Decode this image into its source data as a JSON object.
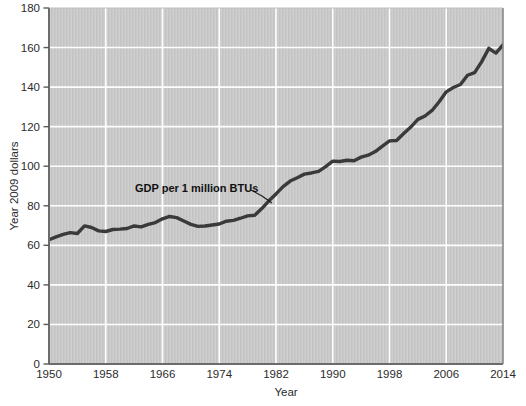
{
  "chart_data": {
    "type": "line",
    "title": "",
    "xlabel": "Year",
    "ylabel": "Year 2009 dollars",
    "xlim": [
      1950,
      2014
    ],
    "ylim": [
      0,
      180
    ],
    "grid": true,
    "legend_position": "none",
    "xticks": [
      1950,
      1958,
      1966,
      1974,
      1982,
      1990,
      1998,
      2006,
      2014
    ],
    "yticks": [
      0,
      20,
      40,
      60,
      80,
      100,
      120,
      140,
      160,
      180
    ],
    "annotations": [
      {
        "text": "GDP per 1 million BTUs",
        "x": 1963.5,
        "y": 88,
        "leader_to_x": 1981.5,
        "leader_to_y": 80
      }
    ],
    "series": [
      {
        "name": "GDP per 1 million BTUs",
        "color": "#3a3a3a",
        "x": [
          1950,
          1951,
          1952,
          1953,
          1954,
          1955,
          1956,
          1957,
          1958,
          1959,
          1960,
          1961,
          1962,
          1963,
          1964,
          1965,
          1966,
          1967,
          1968,
          1969,
          1970,
          1971,
          1972,
          1973,
          1974,
          1975,
          1976,
          1977,
          1978,
          1979,
          1980,
          1981,
          1982,
          1983,
          1984,
          1985,
          1986,
          1987,
          1988,
          1989,
          1990,
          1991,
          1992,
          1993,
          1994,
          1995,
          1996,
          1997,
          1998,
          1999,
          2000,
          2001,
          2002,
          2003,
          2004,
          2005,
          2006,
          2007,
          2008,
          2009,
          2010,
          2011,
          2012,
          2013,
          2014
        ],
        "values": [
          62.8,
          64.3,
          65.5,
          66.4,
          66.0,
          69.8,
          69.0,
          67.3,
          67.0,
          68.0,
          68.2,
          68.5,
          69.8,
          69.3,
          70.6,
          71.5,
          73.4,
          74.6,
          74.0,
          72.3,
          70.6,
          69.6,
          69.8,
          70.3,
          70.8,
          72.2,
          72.6,
          73.7,
          74.9,
          75.2,
          78.6,
          82.5,
          86.0,
          89.7,
          92.5,
          94.2,
          96.0,
          96.6,
          97.4,
          99.8,
          102.6,
          102.4,
          103.0,
          102.8,
          104.6,
          105.6,
          107.4,
          110.2,
          112.8,
          113.0,
          116.5,
          119.8,
          123.7,
          125.4,
          128.2,
          132.6,
          137.6,
          139.8,
          141.3,
          146.0,
          147.3,
          152.9,
          159.6,
          157.2,
          161.3
        ]
      }
    ]
  },
  "axes": {
    "y_label": "Year 2009 dollars",
    "x_label": "Year",
    "y_tick_labels": [
      "180",
      "160",
      "140",
      "120",
      "100",
      "80",
      "60",
      "40",
      "20",
      "0"
    ],
    "x_tick_labels": [
      "1950",
      "1958",
      "1966",
      "1974",
      "1982",
      "1990",
      "1998",
      "2006",
      "2014"
    ]
  },
  "annotation": {
    "label": "GDP per 1 million BTUs"
  },
  "colors": {
    "plot_background": "#c8c8c8",
    "grid": "#ffffff",
    "line": "#3a3a3a",
    "axis_border": "#6e6e6e",
    "page_background": "#ffffff",
    "text": "#2b2b2b"
  }
}
